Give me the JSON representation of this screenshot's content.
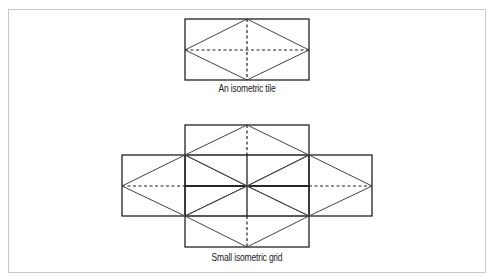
{
  "figure": {
    "top_caption": "An isometric tile",
    "bottom_caption": "Small isometric grid",
    "colors": {
      "frame_border": "#c8c8c8",
      "solid_line": "#222222",
      "diagonal_line": "#444444",
      "dashed_line": "#222222",
      "background": "#ffffff"
    }
  }
}
